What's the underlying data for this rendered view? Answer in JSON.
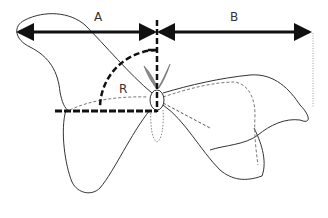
{
  "diagram": {
    "type": "insect wing measurement diagram",
    "labels": {
      "a": "A",
      "b": "B",
      "r": "R"
    },
    "measurements": [
      {
        "id": "A",
        "description": "horizontal span from left wingtip to body midline"
      },
      {
        "id": "B",
        "description": "horizontal span from body midline to right wingtip"
      },
      {
        "id": "R",
        "description": "angle between body axis and wing leading edge"
      }
    ],
    "colors": {
      "stroke": "#333333",
      "arrow": "#111111",
      "dashed_guide": "#111111",
      "dashed_wing": "#777777",
      "antenna_fill": "#8a8a8a",
      "background": "#ffffff"
    }
  }
}
